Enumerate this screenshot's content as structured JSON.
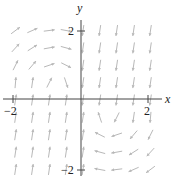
{
  "chart_data": {
    "type": "vector_field",
    "title": "",
    "xlabel": "x",
    "ylabel": "y",
    "xlim": [
      -2.2,
      2.2
    ],
    "ylim": [
      -2.2,
      2.2
    ],
    "x_ticks": [
      {
        "value": -2,
        "label": "−2"
      },
      {
        "value": 2,
        "label": "2"
      }
    ],
    "y_ticks": [
      {
        "value": 2,
        "label": "2"
      },
      {
        "value": -2,
        "label": "−2"
      }
    ],
    "grid": false,
    "arrow_color": "#b8b8b8",
    "axis_color": "#333333",
    "grid_x": [
      -2,
      -1.5,
      -1,
      -0.5,
      0,
      0.5,
      1,
      1.5,
      2
    ],
    "grid_y": [
      2,
      1.5,
      1,
      0.5,
      0,
      -0.5,
      -1,
      -1.5,
      -2
    ]
  },
  "axes": {
    "x_label": "x",
    "y_label": "y",
    "tick_x_neg": "−2",
    "tick_x_pos": "2",
    "tick_y_pos": "2",
    "tick_y_neg": "−2"
  }
}
